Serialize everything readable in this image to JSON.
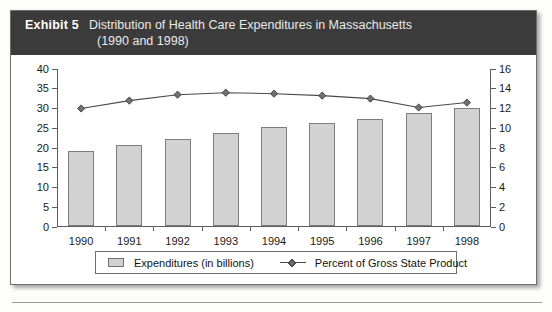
{
  "exhibit": {
    "label": "Exhibit 5",
    "title_line1": "Distribution of Health Care Expenditures in Massachusetts",
    "title_line2": "(1990 and 1998)",
    "header_bg": "#3b3b3b",
    "header_text_color": "#ffffff"
  },
  "legend": {
    "items": [
      {
        "name": "expenditures",
        "label": "Expenditures (in billions)",
        "marker": "box-swatch",
        "color": "#d2d2d2"
      },
      {
        "name": "percent-gsp",
        "label": "Percent of Gross State Product",
        "marker": "line-diamond",
        "color": "#6e6e6e"
      }
    ]
  },
  "chart_data": {
    "type": "bar",
    "title": "Distribution of Health Care Expenditures in Massachusetts (1990 and 1998)",
    "categories": [
      "1990",
      "1991",
      "1992",
      "1993",
      "1994",
      "1995",
      "1996",
      "1997",
      "1998"
    ],
    "xlabel": "",
    "ylabel": "",
    "grid": false,
    "legend_position": "bottom",
    "series": [
      {
        "name": "Expenditures (in billions)",
        "type": "bar",
        "axis": "left",
        "color": "#d2d2d2",
        "border_color": "#7d7d7d",
        "values": [
          19.0,
          20.5,
          22.0,
          23.5,
          25.0,
          26.0,
          27.0,
          28.5,
          30.0
        ]
      },
      {
        "name": "Percent of Gross State Product",
        "type": "line",
        "axis": "right",
        "color": "#4a4a4a",
        "marker": "diamond",
        "values": [
          12.0,
          12.8,
          13.4,
          13.6,
          13.5,
          13.3,
          13.0,
          12.1,
          12.6
        ]
      }
    ],
    "y_left": {
      "label": "",
      "ylim": [
        0,
        40
      ],
      "ticks": [
        0,
        5,
        10,
        15,
        20,
        25,
        30,
        35,
        40
      ]
    },
    "y_right": {
      "label": "",
      "ylim": [
        0,
        16
      ],
      "ticks": [
        0,
        2,
        4,
        6,
        8,
        10,
        12,
        14,
        16
      ]
    }
  }
}
